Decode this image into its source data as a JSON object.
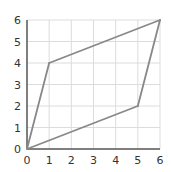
{
  "chart_data": {
    "type": "line",
    "title": "",
    "xlabel": "",
    "ylabel": "",
    "xlim": [
      0,
      6
    ],
    "ylim": [
      0,
      6
    ],
    "grid": true,
    "x_ticks": [
      "0",
      "1",
      "2",
      "3",
      "4",
      "5",
      "6"
    ],
    "y_ticks": [
      "0",
      "1",
      "2",
      "3",
      "4",
      "5",
      "6"
    ],
    "series": [
      {
        "name": "quadrilateral",
        "closed": true,
        "points": [
          [
            0,
            0
          ],
          [
            1,
            4
          ],
          [
            6,
            6
          ],
          [
            5,
            2
          ]
        ]
      }
    ],
    "colors": {
      "grid": "#dcdcdc",
      "axis": "#555555",
      "shape": "#888888",
      "text": "#333333"
    }
  }
}
